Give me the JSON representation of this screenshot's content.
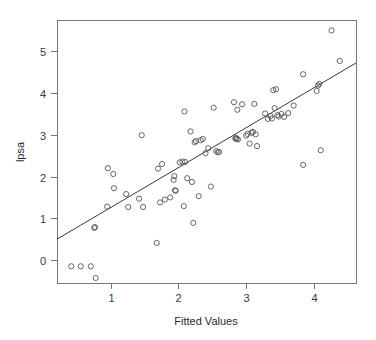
{
  "chart_data": {
    "type": "scatter",
    "title": "",
    "xlabel": "Fitted Values",
    "ylabel": "lpsa",
    "xlim": [
      0.21,
      4.62
    ],
    "ylim": [
      -0.55,
      5.75
    ],
    "xticks": [
      1,
      2,
      3,
      4
    ],
    "yticks": [
      0,
      1,
      2,
      3,
      4,
      5
    ],
    "xtick_labels": [
      "1",
      "2",
      "3",
      "4"
    ],
    "ytick_labels": [
      "0",
      "1",
      "2",
      "3",
      "4",
      "5"
    ],
    "grid": false,
    "legend": "none",
    "marker": "open-circle",
    "marker_radius_px": 2.6,
    "series": [
      {
        "name": "observations",
        "x": [
          0.42,
          0.56,
          0.71,
          0.76,
          0.77,
          0.78,
          0.95,
          0.96,
          1.04,
          1.05,
          1.23,
          1.26,
          1.42,
          1.46,
          1.48,
          1.68,
          1.7,
          1.73,
          1.76,
          1.8,
          1.88,
          1.93,
          1.94,
          1.95,
          1.96,
          2.02,
          2.06,
          2.08,
          2.09,
          2.1,
          2.13,
          2.18,
          2.2,
          2.22,
          2.24,
          2.26,
          2.3,
          2.33,
          2.36,
          2.4,
          2.44,
          2.48,
          2.52,
          2.56,
          2.58,
          2.6,
          2.82,
          2.84,
          2.85,
          2.86,
          2.87,
          2.88,
          2.94,
          3.0,
          3.02,
          3.05,
          3.08,
          3.1,
          3.12,
          3.14,
          3.16,
          3.28,
          3.32,
          3.36,
          3.38,
          3.4,
          3.42,
          3.44,
          3.46,
          3.48,
          3.52,
          3.56,
          3.62,
          3.7,
          3.84,
          4.04,
          4.06,
          4.08,
          4.1,
          4.26,
          4.38
        ],
        "y": [
          -0.15,
          -0.15,
          -0.15,
          0.77,
          0.79,
          -0.43,
          1.28,
          2.2,
          2.06,
          1.72,
          1.58,
          1.27,
          1.47,
          2.99,
          1.27,
          0.41,
          2.19,
          1.38,
          2.3,
          1.45,
          1.5,
          1.92,
          2.01,
          1.67,
          1.66,
          2.34,
          2.36,
          1.29,
          3.56,
          2.35,
          1.96,
          3.08,
          1.87,
          0.89,
          2.82,
          2.85,
          1.53,
          2.87,
          2.9,
          2.56,
          2.68,
          1.76,
          3.65,
          2.61,
          2.58,
          2.59,
          3.78,
          2.91,
          2.93,
          2.9,
          3.6,
          2.89,
          3.73,
          2.98,
          3.02,
          2.79,
          3.05,
          3.07,
          3.74,
          3.01,
          2.73,
          3.51,
          3.38,
          3.45,
          3.39,
          4.07,
          3.64,
          4.09,
          3.47,
          3.44,
          3.5,
          3.43,
          3.52,
          3.7,
          4.45,
          4.05,
          4.18,
          4.22,
          2.63,
          5.5,
          4.77
        ]
      }
    ],
    "fit_line": {
      "name": "regression-line",
      "x0": 0.21,
      "y0": 0.5,
      "x1": 4.62,
      "y1": 4.72
    },
    "extra_points": [
      {
        "x": 3.84,
        "y": 2.28
      }
    ]
  },
  "axes": {
    "box_left_px": 57,
    "box_right_px": 356,
    "box_top_px": 20,
    "box_bottom_px": 283
  }
}
